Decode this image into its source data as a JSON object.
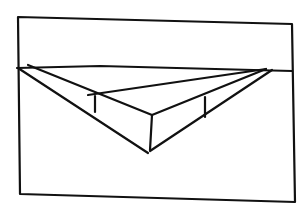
{
  "diagram": {
    "description": "Hand-drawn two-point perspective sketch of a rectangular box below the horizon line inside a rectangular frame",
    "stroke_color": "#111111",
    "background_color": "#ffffff",
    "frame": {
      "points": [
        [
          18,
          17
        ],
        [
          292,
          24
        ],
        [
          295,
          202
        ],
        [
          20,
          194
        ]
      ]
    },
    "horizon_line": {
      "points": [
        [
          17,
          68
        ],
        [
          100,
          66
        ],
        [
          292,
          71
        ]
      ]
    },
    "vanishing_points": {
      "left": [
        18,
        67
      ],
      "right": [
        268,
        69
      ]
    },
    "box": {
      "front_top": [
        152,
        115
      ],
      "front_bottom": [
        148,
        153
      ],
      "left_back_top": [
        95,
        96
      ],
      "left_back_bottom": [
        95,
        112
      ],
      "right_back_top": [
        205,
        97
      ],
      "right_back_bottom": [
        205,
        117
      ]
    },
    "lines": [
      {
        "name": "vp-left-to-front-bottom",
        "from": [
          18,
          68
        ],
        "to": [
          148,
          153
        ]
      },
      {
        "name": "vp-right-to-front-bottom",
        "from": [
          272,
          70
        ],
        "to": [
          150,
          151
        ]
      },
      {
        "name": "vp-left-to-front-top",
        "from": [
          28,
          65
        ],
        "to": [
          152,
          115
        ]
      },
      {
        "name": "vp-right-to-front-top",
        "from": [
          266,
          69
        ],
        "to": [
          152,
          115
        ]
      },
      {
        "name": "vp-right-to-left-back-top",
        "from": [
          266,
          69
        ],
        "to": [
          88,
          95
        ]
      },
      {
        "name": "front-vertical-edge",
        "from": [
          152,
          115
        ],
        "to": [
          150,
          150
        ]
      },
      {
        "name": "left-back-vertical-edge",
        "from": [
          95,
          96
        ],
        "to": [
          95,
          112
        ]
      },
      {
        "name": "right-back-vertical-edge",
        "from": [
          205,
          97
        ],
        "to": [
          205,
          117
        ]
      }
    ]
  }
}
